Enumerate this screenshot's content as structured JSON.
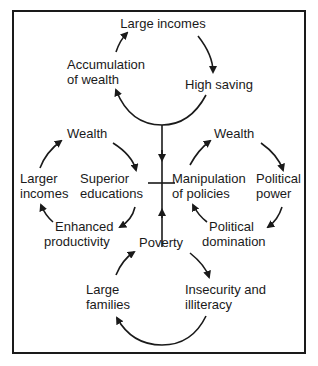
{
  "diagram": {
    "type": "cycle-diagram",
    "top_cycle": {
      "nodes": [
        "Large incomes",
        "High saving",
        "Accumulation of wealth"
      ],
      "labels": {
        "large_incomes": "Large incomes",
        "high_saving": "High saving",
        "accumulation_l1": "Accumulation",
        "accumulation_l2": "of wealth"
      }
    },
    "left_cycle": {
      "nodes": [
        "Wealth",
        "Superior educations",
        "Enhanced productivity",
        "Larger incomes"
      ],
      "labels": {
        "wealth": "Wealth",
        "superior_l1": "Superior",
        "superior_l2": "educations",
        "enhanced_l1": "Enhanced",
        "enhanced_l2": "productivity",
        "larger_l1": "Larger",
        "larger_l2": "incomes"
      }
    },
    "right_cycle": {
      "nodes": [
        "Wealth",
        "Political power",
        "Political domination",
        "Manipulation of policies"
      ],
      "labels": {
        "wealth": "Wealth",
        "power_l1": "Political",
        "power_l2": "power",
        "domination_l1": "Political",
        "domination_l2": "domination",
        "manipulation_l1": "Manipulation",
        "manipulation_l2": "of policies"
      }
    },
    "bottom_cycle": {
      "nodes": [
        "Poverty",
        "Insecurity and illiteracy",
        "Large families"
      ],
      "labels": {
        "poverty": "Poverty",
        "insecurity_l1": "Insecurity and",
        "insecurity_l2": "illiteracy",
        "families_l1": "Large",
        "families_l2": "families"
      }
    },
    "colors": {
      "ink": "#1a1a1a",
      "background": "#ffffff"
    }
  }
}
